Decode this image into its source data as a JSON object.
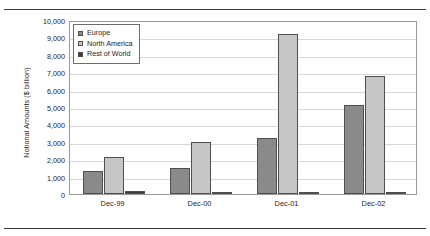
{
  "chart_data": {
    "type": "bar",
    "title": "",
    "xlabel": "",
    "ylabel": "Notional Amounts ($ billion)",
    "categories": [
      "Dec-99",
      "Dec-00",
      "Dec-01",
      "Dec-02"
    ],
    "series": [
      {
        "name": "Europe",
        "values": [
          1300,
          1500,
          3200,
          5100
        ],
        "color": "#8a8a8a"
      },
      {
        "name": "North America",
        "values": [
          2150,
          3000,
          9200,
          6800
        ],
        "color": "#c6c6c6"
      },
      {
        "name": "Rest of World",
        "values": [
          170,
          110,
          110,
          110
        ],
        "color": "#3d3d3d"
      }
    ],
    "ylim": [
      0,
      10000
    ],
    "ytick_values": [
      0,
      1000,
      2000,
      3000,
      4000,
      5000,
      6000,
      7000,
      8000,
      9000,
      10000
    ],
    "ytick_labels": [
      "0",
      "1,000",
      "2,000",
      "3,000",
      "4,000",
      "5,000",
      "6,000",
      "7,000",
      "8,000",
      "9,000",
      "10,000"
    ],
    "grid": true,
    "legend_position": "top-left"
  },
  "legend": {
    "entries": [
      {
        "label": "Europe"
      },
      {
        "label": "North America"
      },
      {
        "label": "Rest of World"
      }
    ]
  }
}
